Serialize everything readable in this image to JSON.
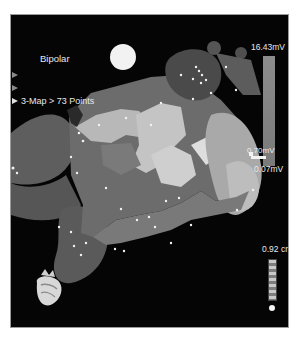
{
  "viewer": {
    "mode_label": "Bipolar",
    "map_label": "3-Map > 73 Points",
    "map_point_count": 73,
    "side_markers": [
      "collapsed",
      "collapsed",
      "expanded"
    ]
  },
  "color_scale": {
    "max_label": "16.43mV",
    "mid_label": "0.70mV",
    "min_label": "0.07mV",
    "bar_color": "#868686"
  },
  "ruler": {
    "label": "0.92 cm"
  },
  "icons": {
    "light_source": "light-sphere-icon",
    "orientation": "heart-orientation-icon",
    "marker": "triangle-right-icon"
  },
  "colors": {
    "background": "#050505",
    "label_text": "#e8e8e8",
    "page_bg": "#ffffff"
  }
}
